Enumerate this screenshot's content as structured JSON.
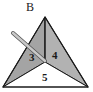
{
  "diagram": {
    "vertex_label": "B",
    "faces": [
      {
        "id": "3",
        "label": "3",
        "fill": "#a8a8a8"
      },
      {
        "id": "4",
        "label": "4",
        "fill": "#b4b4b4"
      },
      {
        "id": "5",
        "label": "5",
        "fill": "#ffffff"
      }
    ],
    "left_face_fill": "#9c9c9c",
    "edge_color": "#1a1a1a",
    "rod_color": "#9a9a9a"
  }
}
